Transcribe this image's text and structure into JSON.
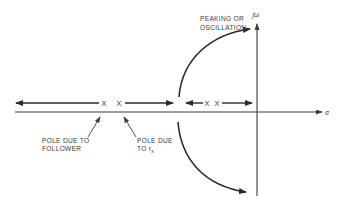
{
  "diagram": {
    "type": "root-locus",
    "axes": {
      "imaginary_label": "jω",
      "real_label": "σ"
    },
    "poles": [
      {
        "id": "follower-pole",
        "glyph": "X"
      },
      {
        "id": "rx-pole",
        "glyph": "X"
      },
      {
        "id": "pole-3",
        "glyph": "X"
      },
      {
        "id": "pole-4",
        "glyph": "X"
      }
    ],
    "annotations": {
      "peaking": {
        "line1": "PEAKING OR",
        "line2": "OSCILLATION"
      },
      "follower": {
        "line1": "POLE DUE TO",
        "line2": "FOLLOWER"
      },
      "rx": {
        "line1": "POLE DUE",
        "line2": "TO r",
        "subscript": "x"
      }
    },
    "colors": {
      "stroke": "#2a2a2a",
      "axis": "#3c3c3c",
      "text": "#3a3a3a",
      "background": "#ffffff"
    }
  }
}
